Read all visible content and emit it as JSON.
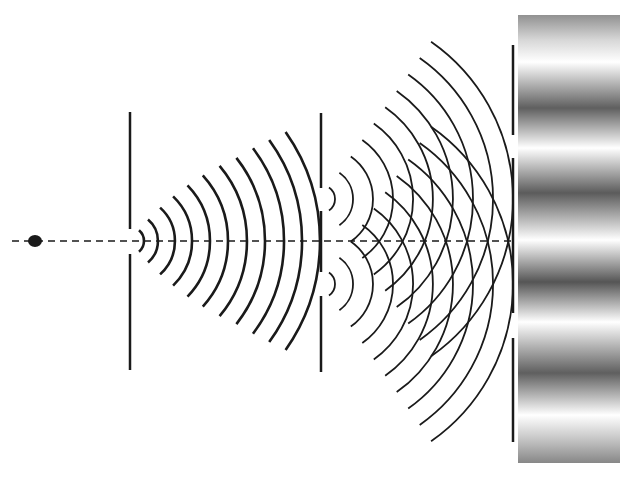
{
  "diagram": {
    "type": "double-slit interference",
    "colors": {
      "ink": "#1a1a1a",
      "background": "#ffffff",
      "fringe_dark": "#3a3a3a",
      "fringe_light": "#ffffff"
    },
    "source": {
      "x": 35,
      "y": 241,
      "rx": 7,
      "ry": 6
    },
    "axis": {
      "y": 241,
      "x1": 12,
      "x2": 514,
      "dash": "7 5"
    },
    "barrier1": {
      "x": 130,
      "segments": [
        [
          112,
          229
        ],
        [
          254,
          370
        ]
      ]
    },
    "barrier2": {
      "x": 321,
      "segments": [
        [
          113,
          188
        ],
        [
          211,
          272
        ],
        [
          296,
          372
        ]
      ]
    },
    "screen_edge": {
      "x": 513,
      "segments": [
        [
          45,
          135
        ],
        [
          158,
          313
        ],
        [
          338,
          442
        ]
      ]
    },
    "single_slit_waves": {
      "cx": 130,
      "cy": 241,
      "radii": [
        14,
        28,
        45,
        62,
        80,
        98,
        117,
        135,
        154,
        172,
        190
      ],
      "half_angles": [
        50,
        50,
        48,
        46,
        44,
        42,
        40,
        38,
        37,
        36,
        35
      ]
    },
    "double_slit_waves": {
      "slits": [
        {
          "cx": 321,
          "cy": 199
        },
        {
          "cx": 321,
          "cy": 284
        }
      ],
      "radii": [
        14,
        32,
        52,
        72,
        92,
        112,
        132,
        152,
        172,
        192
      ],
      "half_angle": 55
    },
    "screen_pattern": {
      "x": 518,
      "y": 15,
      "width": 102,
      "height": 448,
      "stops": [
        {
          "y": 15,
          "shade": 0.55
        },
        {
          "y": 40,
          "shade": 0.2
        },
        {
          "y": 62,
          "shade": 0.0
        },
        {
          "y": 108,
          "shade": 0.8
        },
        {
          "y": 148,
          "shade": 0.0
        },
        {
          "y": 193,
          "shade": 0.82
        },
        {
          "y": 240,
          "shade": 0.0
        },
        {
          "y": 282,
          "shade": 0.85
        },
        {
          "y": 322,
          "shade": 0.0
        },
        {
          "y": 373,
          "shade": 0.8
        },
        {
          "y": 415,
          "shade": 0.0
        },
        {
          "y": 440,
          "shade": 0.3
        },
        {
          "y": 463,
          "shade": 0.6
        }
      ]
    }
  }
}
